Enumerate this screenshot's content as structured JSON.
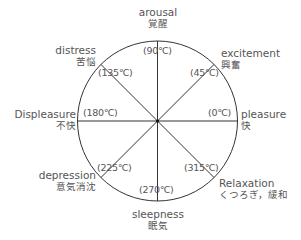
{
  "colors": {
    "line": "#333333",
    "text": "#555555",
    "background": "#ffffff"
  },
  "circle": {
    "cx": 157.5,
    "cy": 121,
    "r": 80
  },
  "axes": [
    {
      "angle": 0,
      "deg_label": "(0℃)",
      "en": "pleasure",
      "ja": "快"
    },
    {
      "angle": 45,
      "deg_label": "(45℃)",
      "en": "excitement",
      "ja": "興奮"
    },
    {
      "angle": 90,
      "deg_label": "(90℃)",
      "en": "arousal",
      "ja": "覚醒"
    },
    {
      "angle": 135,
      "deg_label": "(135℃)",
      "en": "distress",
      "ja": "苦悩"
    },
    {
      "angle": 180,
      "deg_label": "(180℃)",
      "en": "Displeasure",
      "ja": "不快"
    },
    {
      "angle": 225,
      "deg_label": "(225℃)",
      "en": "depression",
      "ja": "意気消沈"
    },
    {
      "angle": 270,
      "deg_label": "(270℃)",
      "en": "sleepness",
      "ja": "眠気"
    },
    {
      "angle": 315,
      "deg_label": "(315℃)",
      "en": "Relaxation",
      "ja": "くつろぎ，緩和"
    }
  ]
}
